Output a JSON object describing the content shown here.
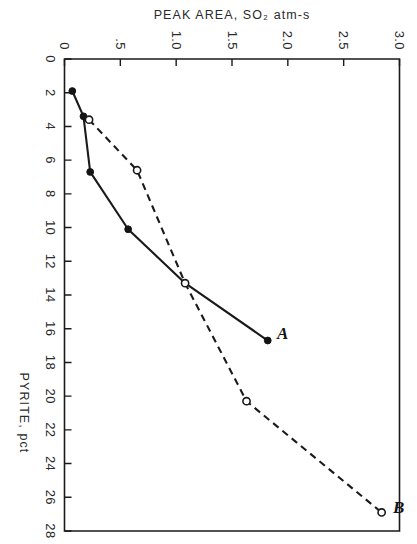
{
  "figure": {
    "orientation_note": "sideways",
    "series_label_a": "A",
    "series_label_b": "B"
  },
  "chart_data": {
    "type": "line",
    "title": "",
    "xlabel": "PYRITE, pct",
    "ylabel": "PEAK AREA, SO2 atm-s",
    "ylabel_display": "PEAK AREA, SO₂ atm-s",
    "xlim": [
      0,
      28
    ],
    "ylim": [
      0,
      3.0
    ],
    "xticks": [
      0,
      2,
      4,
      6,
      8,
      10,
      12,
      14,
      16,
      18,
      20,
      22,
      24,
      26,
      28
    ],
    "xticklabels": [
      "0",
      "2",
      "4",
      "6",
      "8",
      "10",
      "12",
      "14",
      "16",
      "18",
      "20",
      "22",
      "24",
      "26",
      "28"
    ],
    "yticks": [
      0,
      0.5,
      1.0,
      1.5,
      2.0,
      2.5,
      3.0
    ],
    "yticklabels": [
      "0",
      ".5",
      "1.0",
      "1.5",
      "2.0",
      "2.5",
      "3.0"
    ],
    "grid": false,
    "legend": "inline-curve-labels",
    "series": [
      {
        "name": "A",
        "marker": "filled-circle",
        "linestyle": "solid",
        "color": "#141414",
        "x": [
          1.9,
          3.4,
          6.7,
          10.1,
          13.3,
          16.7
        ],
        "y": [
          0.07,
          0.17,
          0.23,
          0.57,
          1.08,
          1.82
        ]
      },
      {
        "name": "B",
        "marker": "open-circle",
        "linestyle": "dashed",
        "color": "#141414",
        "x": [
          3.6,
          6.6,
          13.3,
          20.3,
          26.9
        ],
        "y": [
          0.22,
          0.65,
          1.08,
          1.63,
          2.84
        ]
      }
    ]
  },
  "colors": {
    "ink": "#1a1a1a",
    "paper": "#ffffff"
  }
}
